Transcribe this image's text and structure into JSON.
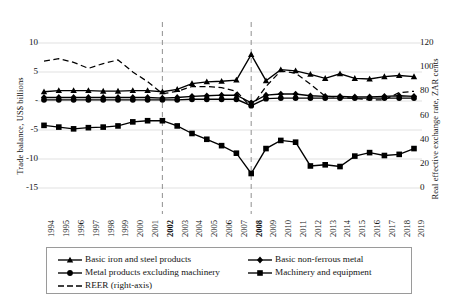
{
  "chart_data": {
    "type": "line",
    "title": "",
    "xlabel": "",
    "ylabel": "Trade balance, US$ billions",
    "y2label": "Real effective exchange rate, ZAR cents",
    "grid": true,
    "legend_position": "bottom",
    "ylim": [
      -15,
      10
    ],
    "y2lim": [
      0,
      120
    ],
    "yticks": [
      10,
      5,
      0,
      -5,
      -10,
      -15
    ],
    "ytick_labels": [
      "10",
      "5",
      "-",
      "-5",
      "-10",
      "-15"
    ],
    "y2ticks": [
      120,
      100,
      80,
      60,
      40,
      20,
      0
    ],
    "y2tick_labels": [
      "120",
      "100",
      "80",
      "60",
      "40",
      "20",
      "0"
    ],
    "x": [
      1994,
      1995,
      1996,
      1997,
      1998,
      1999,
      2000,
      2001,
      2002,
      2003,
      2004,
      2005,
      2006,
      2007,
      2008,
      2009,
      2010,
      2011,
      2012,
      2013,
      2014,
      2015,
      2016,
      2017,
      2018,
      2019
    ],
    "xtick_labels": [
      "1994",
      "1995",
      "1996",
      "1997",
      "1998",
      "1999",
      "2000",
      "2001",
      "2002",
      "2003",
      "2004",
      "2005",
      "2006",
      "2007",
      "2008",
      "2009",
      "2010",
      "2011",
      "2012",
      "2013",
      "2014",
      "2015",
      "2016",
      "2017",
      "2018",
      "2019"
    ],
    "annotations": [
      {
        "type": "vline",
        "x": 2002,
        "style": "dashed",
        "label": "2002"
      },
      {
        "type": "vline",
        "x": 2008,
        "style": "dashed",
        "label": "2008"
      }
    ],
    "series": [
      {
        "name": "Basic iron and steel products",
        "marker": "triangle",
        "axis": "left",
        "values": [
          1.6,
          1.8,
          1.8,
          1.8,
          1.7,
          1.7,
          1.8,
          1.8,
          1.6,
          2.0,
          3.0,
          3.3,
          3.4,
          3.6,
          8.0,
          3.5,
          5.4,
          5.2,
          4.6,
          3.9,
          4.7,
          3.9,
          3.8,
          4.2,
          4.4,
          4.2
        ]
      },
      {
        "name": "Basic non-ferrous metal",
        "marker": "diamond",
        "axis": "left",
        "values": [
          0.6,
          0.6,
          0.6,
          0.6,
          0.6,
          0.6,
          0.6,
          0.6,
          0.5,
          0.6,
          0.8,
          0.9,
          1.0,
          1.0,
          -0.3,
          1.0,
          1.2,
          1.2,
          0.9,
          0.8,
          0.8,
          0.7,
          0.7,
          0.8,
          0.9,
          0.8
        ]
      },
      {
        "name": "Metal products excluding machinery",
        "marker": "circle",
        "axis": "left",
        "values": [
          0.2,
          0.2,
          0.2,
          0.2,
          0.2,
          0.2,
          0.2,
          0.2,
          0.2,
          0.2,
          0.3,
          0.3,
          0.3,
          0.3,
          -0.8,
          0.4,
          0.5,
          0.5,
          0.5,
          0.5,
          0.5,
          0.5,
          0.5,
          0.5,
          0.5,
          0.5
        ]
      },
      {
        "name": "Machinery and equipment",
        "marker": "square",
        "axis": "left",
        "values": [
          -4.2,
          -4.5,
          -4.8,
          -4.6,
          -4.5,
          -4.3,
          -3.6,
          -3.4,
          -3.4,
          -4.3,
          -5.6,
          -6.6,
          -7.7,
          -9.0,
          -12.5,
          -8.2,
          -6.8,
          -7.1,
          -11.2,
          -11.0,
          -11.3,
          -9.5,
          -8.9,
          -9.4,
          -9.2,
          -8.2
        ]
      },
      {
        "name": "REER (right-axis)",
        "marker": "none",
        "style": "dashed",
        "axis": "right",
        "values": [
          105,
          107,
          104,
          99,
          103,
          106,
          96,
          88,
          78,
          80,
          84,
          84,
          83,
          80,
          67,
          84,
          97,
          95,
          86,
          76,
          75,
          74,
          73,
          73,
          79,
          80
        ]
      }
    ]
  },
  "legend": {
    "entries": [
      {
        "label": "Basic iron and steel products",
        "marker": "triangle"
      },
      {
        "label": "Basic non-ferrous metal",
        "marker": "diamond"
      },
      {
        "label": "Metal products excluding machinery",
        "marker": "circle"
      },
      {
        "label": "Machinery and equipment",
        "marker": "square"
      },
      {
        "label": "REER (right-axis)",
        "marker": "dashed-line"
      }
    ]
  },
  "colors": {
    "line": "#000000",
    "grid": "#d9d9d9",
    "vline": "#9a9a9a",
    "text": "#141414",
    "background": "#ffffff"
  }
}
